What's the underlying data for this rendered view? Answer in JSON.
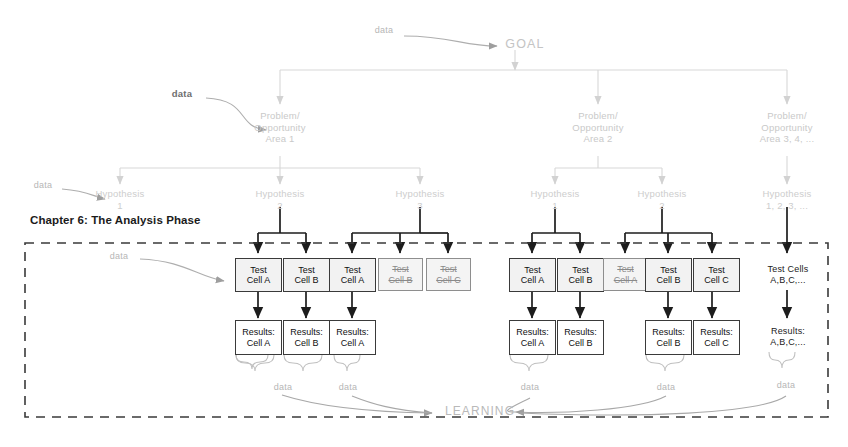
{
  "chapter": {
    "heading": "Chapter 6: The Analysis Phase"
  },
  "goal": {
    "label": "GOAL"
  },
  "learning": {
    "label": "LEARNING"
  },
  "data_labels": {
    "to_goal": "data",
    "to_area1": "data",
    "to_hypothesis1": "data",
    "to_testcell": "data",
    "brace_g1": "data",
    "brace_g2": "data",
    "brace_g3": "data",
    "brace_g4": "data",
    "brace_g5": "data"
  },
  "problem_areas": [
    {
      "id": "area-1",
      "label": "Problem/\nOpportunity\nArea 1"
    },
    {
      "id": "area-2",
      "label": "Problem/\nOpportunity\nArea 2"
    },
    {
      "id": "area-3",
      "label": "Problem/\nOpportunity\nArea 3, 4, ..."
    }
  ],
  "hypotheses": [
    {
      "id": "h1-1",
      "label": "Hypothesis\n1"
    },
    {
      "id": "h1-2",
      "label": "Hypothesis\n2"
    },
    {
      "id": "h1-3",
      "label": "Hypothesis\n3"
    },
    {
      "id": "h2-1",
      "label": "Hypothesis\n1"
    },
    {
      "id": "h2-2",
      "label": "Hypothesis\n2"
    },
    {
      "id": "h3-1",
      "label": "Hypothesis\n1, 2, 3, ..."
    }
  ],
  "test_cells": [
    {
      "id": "g1-a",
      "label": "Test\nCell A",
      "struck": false,
      "boxed": true
    },
    {
      "id": "g1-b",
      "label": "Test\nCell B",
      "struck": false,
      "boxed": true
    },
    {
      "id": "g2-a",
      "label": "Test\nCell A",
      "struck": false,
      "boxed": true
    },
    {
      "id": "g2-b",
      "label": "Test\nCell B",
      "struck": true,
      "boxed": true
    },
    {
      "id": "g2-c",
      "label": "Test\nCell C",
      "struck": true,
      "boxed": true
    },
    {
      "id": "g3-a",
      "label": "Test\nCell A",
      "struck": false,
      "boxed": true
    },
    {
      "id": "g3-b",
      "label": "Test\nCell B",
      "struck": false,
      "boxed": true
    },
    {
      "id": "g4-a",
      "label": "Test\nCell A",
      "struck": true,
      "boxed": true
    },
    {
      "id": "g4-b",
      "label": "Test\nCell B",
      "struck": false,
      "boxed": true
    },
    {
      "id": "g4-c",
      "label": "Test\nCell C",
      "struck": false,
      "boxed": true
    },
    {
      "id": "g5-all",
      "label": "Test Cells\nA,B,C,...",
      "struck": false,
      "boxed": false
    }
  ],
  "results": [
    {
      "id": "r1-a",
      "label": "Results:\nCell A",
      "boxed": true
    },
    {
      "id": "r1-b",
      "label": "Results:\nCell B",
      "boxed": true
    },
    {
      "id": "r2-a",
      "label": "Results:\nCell A",
      "boxed": true
    },
    {
      "id": "r3-a",
      "label": "Results:\nCell A",
      "boxed": true
    },
    {
      "id": "r3-b",
      "label": "Results:\nCell B",
      "boxed": true
    },
    {
      "id": "r4-b",
      "label": "Results:\nCell B",
      "boxed": true
    },
    {
      "id": "r4-c",
      "label": "Results:\nCell C",
      "boxed": true
    },
    {
      "id": "r5-all",
      "label": "Results:\nA,B,C,...",
      "boxed": false
    }
  ],
  "colors": {
    "faint_gray": "#c9c9c9",
    "mid_gray": "#9a9a9a",
    "dark_ink": "#1b1b1b",
    "box_fill": "#f2f2f2",
    "dashed_border": "#3a3a3a"
  }
}
